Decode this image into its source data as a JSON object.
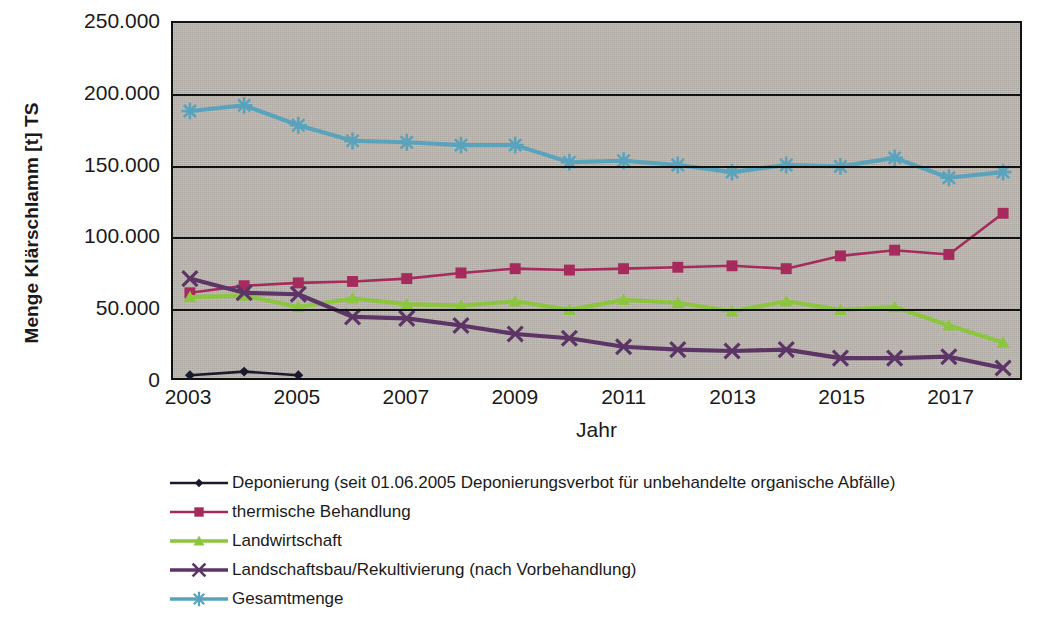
{
  "chart_data": {
    "type": "line",
    "title": "",
    "xlabel": "Jahr",
    "ylabel": "Menge Klärschlamm [t] TS",
    "ylim": [
      0,
      250000
    ],
    "ytick_values": [
      0,
      50000,
      100000,
      150000,
      200000,
      250000
    ],
    "ytick_labels": [
      "0",
      "50.000",
      "100.000",
      "150.000",
      "200.000",
      "250.000"
    ],
    "x": [
      2003,
      2004,
      2005,
      2006,
      2007,
      2008,
      2009,
      2010,
      2011,
      2012,
      2013,
      2014,
      2015,
      2016,
      2017,
      2018
    ],
    "xtick_labels": [
      "2003",
      "2005",
      "2007",
      "2009",
      "2011",
      "2013",
      "2015",
      "2017"
    ],
    "xtick_values": [
      2003,
      2005,
      2007,
      2009,
      2011,
      2013,
      2015,
      2017
    ],
    "grid": true,
    "legend_position": "bottom-left",
    "series": [
      {
        "name": "Deponierung (seit 01.06.2005 Deponierungsverbot für unbehandelte organische Abfälle)",
        "color": "#1a1a2e",
        "marker": "diamond",
        "values": [
          2000,
          4500,
          2000,
          null,
          null,
          null,
          null,
          null,
          null,
          null,
          null,
          null,
          null,
          null,
          null,
          null
        ]
      },
      {
        "name": "thermische Behandlung",
        "color": "#a62a5c",
        "marker": "square",
        "values": [
          60000,
          65000,
          67000,
          68000,
          70000,
          74000,
          77000,
          76000,
          77000,
          78000,
          79000,
          77000,
          86000,
          90000,
          87000,
          116000
        ]
      },
      {
        "name": "Landwirtschaft",
        "color": "#8cc63e",
        "marker": "triangle",
        "values": [
          57000,
          58000,
          50000,
          56000,
          52000,
          51000,
          54000,
          48000,
          55000,
          53000,
          47000,
          54000,
          48000,
          50000,
          37000,
          25000
        ]
      },
      {
        "name": "Landschaftsbau/Rekultivierung (nach Vorbehandlung)",
        "color": "#5c3566",
        "marker": "x",
        "values": [
          70000,
          60000,
          59000,
          43000,
          42000,
          37000,
          31000,
          28000,
          22000,
          20000,
          19000,
          20000,
          14000,
          14000,
          15000,
          7000
        ]
      },
      {
        "name": "Gesamtmenge",
        "color": "#5aa3bd",
        "marker": "asterisk",
        "values": [
          188000,
          192000,
          178000,
          167000,
          166000,
          164000,
          164000,
          152000,
          153000,
          150000,
          145000,
          150000,
          149000,
          155000,
          141000,
          145000
        ]
      }
    ]
  },
  "axes": {
    "y_title": "Menge Klärschlamm [t] TS",
    "x_title": "Jahr"
  },
  "colors": {
    "plot_background": "#bdb8b0",
    "axis": "#111111",
    "deponierung": "#1a1a2e",
    "thermische": "#a62a5c",
    "landwirtschaft": "#8cc63e",
    "landschaftsbau": "#5c3566",
    "gesamtmenge": "#5aa3bd"
  }
}
